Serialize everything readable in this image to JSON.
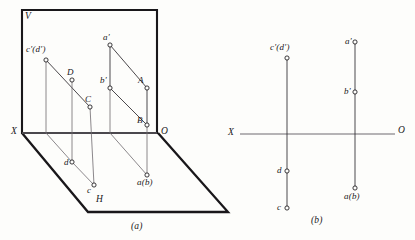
{
  "figure": {
    "type": "engineering-drawing",
    "colors": {
      "ink": "#19171a",
      "thin_line": "#3a363b",
      "axis_line": "#6f6a70",
      "paper": "#fdfdfb"
    },
    "captions": [
      {
        "id": "caption-a",
        "text": "(a)"
      },
      {
        "id": "caption-b",
        "text": "(b)"
      }
    ]
  },
  "pictorial": {
    "name": "two-plane pictorial projection",
    "plane_labels": [
      {
        "id": "v-plane-label",
        "text": "V"
      },
      {
        "id": "h-plane-label",
        "text": "H"
      }
    ],
    "axis_labels": [
      {
        "id": "axis-x-label",
        "text": "X"
      },
      {
        "id": "axis-o-label",
        "text": "O"
      }
    ],
    "points": [
      {
        "id": "cd-prime",
        "text": "c′(d′)",
        "x": 46,
        "y": 60
      },
      {
        "id": "point-d-space",
        "text": "D",
        "x": 72,
        "y": 80
      },
      {
        "id": "point-c-space",
        "text": "C",
        "x": 90,
        "y": 107
      },
      {
        "id": "a-prime",
        "text": "a′",
        "x": 110,
        "y": 45
      },
      {
        "id": "b-prime",
        "text": "b′",
        "x": 110,
        "y": 88
      },
      {
        "id": "point-a-space",
        "text": "A",
        "x": 147,
        "y": 88
      },
      {
        "id": "point-b-space",
        "text": "B",
        "x": 147,
        "y": 125
      },
      {
        "id": "point-d-plan",
        "text": "d",
        "x": 72,
        "y": 162
      },
      {
        "id": "point-c-plan",
        "text": "c",
        "x": 94,
        "y": 185
      },
      {
        "id": "ab-plan",
        "text": "a(b)",
        "x": 147,
        "y": 175
      }
    ]
  },
  "orthographic": {
    "name": "flattened two-view projection",
    "axis_labels": [
      {
        "id": "axis-x-label",
        "text": "X"
      },
      {
        "id": "axis-o-label",
        "text": "O"
      }
    ],
    "points": [
      {
        "id": "cd-prime",
        "text": "c′(d′)",
        "x": 287,
        "y": 58
      },
      {
        "id": "point-d-plan",
        "text": "d",
        "x": 287,
        "y": 171
      },
      {
        "id": "point-c-plan",
        "text": "c",
        "x": 287,
        "y": 208
      },
      {
        "id": "a-prime",
        "text": "a′",
        "x": 355,
        "y": 42
      },
      {
        "id": "b-prime",
        "text": "b′",
        "x": 355,
        "y": 92
      },
      {
        "id": "ab-plan",
        "text": "a(b)",
        "x": 355,
        "y": 188
      }
    ],
    "axis": {
      "y": 134,
      "x_start": 240,
      "x_end": 395
    }
  }
}
